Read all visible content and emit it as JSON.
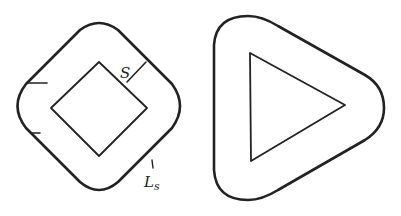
{
  "figures": [
    {
      "name": "rounded-square-conductor",
      "labels": {
        "spacing": "S",
        "length_main": "L",
        "length_sub": "s"
      }
    },
    {
      "name": "rounded-triangle-conductor",
      "labels": {}
    }
  ],
  "colors": {
    "stroke": "#222222",
    "background": "#ffffff"
  }
}
